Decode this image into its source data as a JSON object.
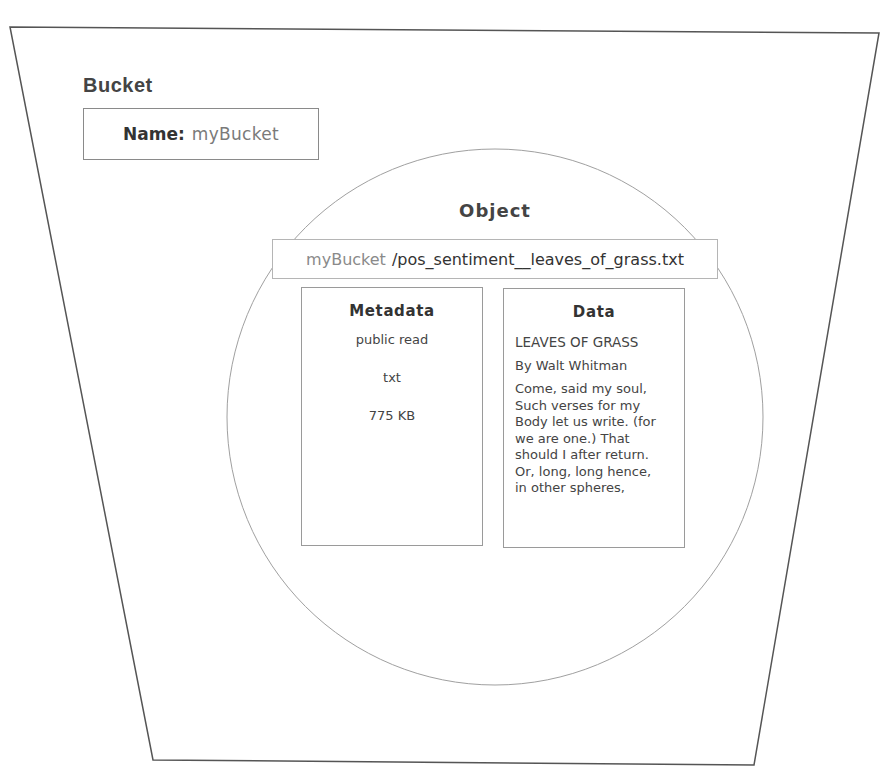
{
  "bucket": {
    "title": "Bucket",
    "name_label": "Name:",
    "name_value": "myBucket"
  },
  "object": {
    "title": "Object",
    "path_bucket": "myBucket",
    "path_key": "/pos_sentiment__leaves_of_grass.txt",
    "metadata": {
      "title": "Metadata",
      "items": [
        "public read",
        "txt",
        "775 KB"
      ]
    },
    "data": {
      "title": "Data",
      "heading": "LEAVES OF GRASS",
      "byline": "By Walt Whitman",
      "body_lines": [
        "Come, said my soul,",
        "Such verses for my",
        "Body let us write. (for",
        "we are one.) That",
        "should I after return.",
        "Or, long, long hence,",
        "in other spheres,"
      ]
    }
  },
  "colors": {
    "stroke": "#555555",
    "light_stroke": "#9a9a9a",
    "text": "#3a3a3a",
    "muted_text": "#7a7a7a"
  }
}
